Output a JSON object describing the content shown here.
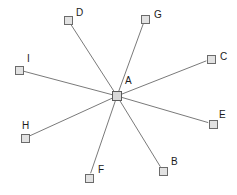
{
  "diagram": {
    "type": "star-network",
    "background_color": "#ffffff",
    "edge_color": "#7a7a7a",
    "node_fill_color": "#e2e2e2",
    "node_border_color": "#6b6b6b",
    "label_color": "#1b1b1b",
    "canvas": {
      "width": 237,
      "height": 195
    },
    "hub": {
      "id": "A",
      "label": "A",
      "x": 117,
      "y": 96,
      "label_x": 125,
      "label_y": 76
    },
    "nodes": [
      {
        "id": "B",
        "label": "B",
        "x": 163,
        "y": 171,
        "label_x": 171,
        "label_y": 157
      },
      {
        "id": "C",
        "label": "C",
        "x": 211,
        "y": 59,
        "label_x": 220,
        "label_y": 52
      },
      {
        "id": "D",
        "label": "D",
        "x": 68,
        "y": 20,
        "label_x": 76,
        "label_y": 8
      },
      {
        "id": "E",
        "label": "E",
        "x": 213,
        "y": 124,
        "label_x": 219,
        "label_y": 110
      },
      {
        "id": "F",
        "label": "F",
        "x": 89,
        "y": 178,
        "label_x": 98,
        "label_y": 165
      },
      {
        "id": "G",
        "label": "G",
        "x": 145,
        "y": 19,
        "label_x": 154,
        "label_y": 10
      },
      {
        "id": "H",
        "label": "H",
        "x": 25,
        "y": 138,
        "label_x": 22,
        "label_y": 121
      },
      {
        "id": "I",
        "label": "I",
        "x": 19,
        "y": 70,
        "label_x": 27,
        "label_y": 54
      }
    ],
    "edges": [
      {
        "from": "A",
        "to": "B"
      },
      {
        "from": "A",
        "to": "C"
      },
      {
        "from": "A",
        "to": "D"
      },
      {
        "from": "A",
        "to": "E"
      },
      {
        "from": "A",
        "to": "F"
      },
      {
        "from": "A",
        "to": "G"
      },
      {
        "from": "A",
        "to": "H"
      },
      {
        "from": "A",
        "to": "I"
      }
    ]
  }
}
